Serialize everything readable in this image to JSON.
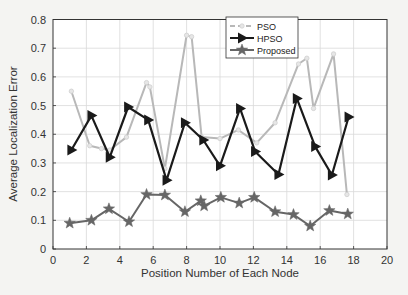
{
  "chart_data": {
    "type": "line",
    "title": "",
    "xlabel": "Position Number of Each Node",
    "ylabel": "Average Localization Error",
    "xlim": [
      0,
      20
    ],
    "ylim": [
      0,
      0.8
    ],
    "xticks": [
      "0",
      "2",
      "4",
      "6",
      "8",
      "10",
      "12",
      "14",
      "16",
      "18",
      "20"
    ],
    "yticks": [
      "0",
      "0.1",
      "0.2",
      "0.3",
      "0.4",
      "0.5",
      "0.6",
      "0.7",
      "0.8"
    ],
    "grid": true,
    "legend_position": "top-center",
    "series": [
      {
        "name": "PSO",
        "color": "#b8b8b8",
        "style": "dashed",
        "marker": "circle",
        "x": [
          1.1,
          2.2,
          2.9,
          3.4,
          4.4,
          5.6,
          5.8,
          6.7,
          8.0,
          8.3,
          8.9,
          10.0,
          11.1,
          12.2,
          13.3,
          14.7,
          15.2,
          15.6,
          16.8,
          17.6
        ],
        "y": [
          0.55,
          0.36,
          0.35,
          0.345,
          0.39,
          0.58,
          0.565,
          0.28,
          0.745,
          0.74,
          0.39,
          0.385,
          0.415,
          0.37,
          0.44,
          0.645,
          0.665,
          0.49,
          0.68,
          0.19
        ]
      },
      {
        "name": "HPSO",
        "color": "#1a1a1a",
        "style": "solid",
        "marker": "triangle-right",
        "x": [
          1.1,
          2.3,
          3.4,
          4.5,
          5.7,
          6.8,
          7.9,
          9.0,
          10.0,
          11.2,
          12.1,
          13.5,
          14.6,
          15.7,
          16.7,
          17.7
        ],
        "y": [
          0.345,
          0.465,
          0.32,
          0.495,
          0.45,
          0.24,
          0.44,
          0.38,
          0.29,
          0.49,
          0.34,
          0.26,
          0.525,
          0.357,
          0.258,
          0.46
        ]
      },
      {
        "name": "Proposed",
        "color": "#666666",
        "style": "solid",
        "marker": "star",
        "x": [
          1.0,
          2.3,
          3.35,
          4.55,
          5.6,
          6.7,
          7.9,
          8.85,
          9.05,
          10.05,
          11.15,
          12.05,
          13.3,
          14.4,
          15.4,
          16.55,
          17.65
        ],
        "y": [
          0.09,
          0.1,
          0.14,
          0.095,
          0.19,
          0.188,
          0.13,
          0.168,
          0.15,
          0.18,
          0.16,
          0.18,
          0.13,
          0.12,
          0.08,
          0.134,
          0.122
        ]
      }
    ]
  }
}
